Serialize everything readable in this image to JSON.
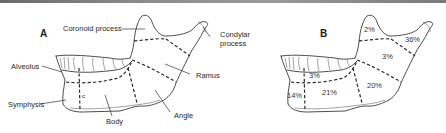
{
  "figure": {
    "panel_a": {
      "letter": "A",
      "labels": {
        "coronoid": "Coronoid process",
        "condylar_line1": "Condylar",
        "condylar_line2": "process",
        "alveolus": "Alveolus",
        "ramus": "Ramus",
        "symphysis": "Symphysis",
        "body": "Body",
        "angle": "Angle",
        "canine_mark": "c"
      }
    },
    "panel_b": {
      "letter": "B",
      "percentages": {
        "coronoid": "2%",
        "condylar": "36%",
        "ramus": "3%",
        "alveolus": "3%",
        "angle": "20%",
        "body": "21%",
        "symphysis": "14%"
      }
    }
  }
}
